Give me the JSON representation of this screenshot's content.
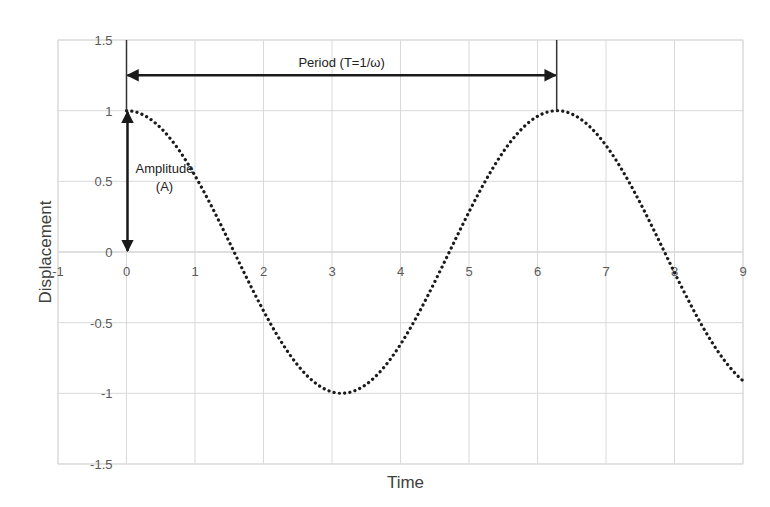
{
  "chart_data": {
    "type": "line",
    "title": "",
    "xlabel": "Time",
    "ylabel": "Displacement",
    "xlim": [
      -1,
      9
    ],
    "ylim": [
      -1.5,
      1.5
    ],
    "grid": true,
    "x_ticks": [
      -1,
      0,
      1,
      2,
      3,
      4,
      5,
      6,
      7,
      8,
      9
    ],
    "x_tick_labels": [
      "-1",
      "0",
      "1",
      "2",
      "3",
      "4",
      "5",
      "6",
      "7",
      "8",
      "9"
    ],
    "y_ticks": [
      1.5,
      1,
      0.5,
      0,
      -0.5,
      -1,
      -1.5
    ],
    "y_tick_labels": [
      "1.5",
      "1",
      "0.5",
      "0",
      "-0.5",
      "-1",
      "-1.5"
    ],
    "series": [
      {
        "name": "Displacement",
        "function": "cos(t)",
        "style": "dotted",
        "color": "#1a1a1a",
        "x": [
          0,
          0.5,
          1,
          1.5,
          2,
          2.5,
          3,
          3.14,
          3.5,
          4,
          4.5,
          5,
          5.5,
          6,
          6.28,
          6.5,
          7,
          7.5,
          8,
          8.5,
          9
        ],
        "values": [
          1,
          0.878,
          0.54,
          0.071,
          -0.416,
          -0.801,
          -0.99,
          -1,
          -0.936,
          -0.654,
          -0.211,
          0.284,
          0.709,
          0.96,
          1,
          0.977,
          0.754,
          0.347,
          -0.146,
          -0.602,
          -0.911
        ]
      }
    ],
    "annotations": [
      {
        "type": "double-arrow-horizontal",
        "label": "Period (T=1/ω)",
        "x_from": 0,
        "x_to": 6.28,
        "y": 1.25
      },
      {
        "type": "double-arrow-vertical",
        "label_lines": [
          "Amplitude",
          "(A)"
        ],
        "x": 0,
        "y_from": 0,
        "y_to": 1
      },
      {
        "type": "reference-line",
        "x": 0,
        "y_from": 1,
        "y_to": 1.5
      },
      {
        "type": "reference-line",
        "x": 6.28,
        "y_from": 1,
        "y_to": 1.5
      }
    ],
    "legend": "none"
  }
}
